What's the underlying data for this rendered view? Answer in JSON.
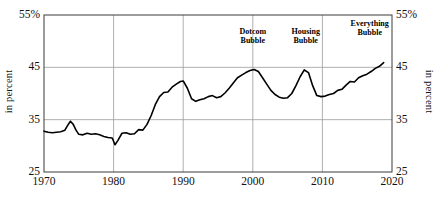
{
  "chart_data": {
    "type": "line",
    "title": "",
    "subtitle": "",
    "xlabel": "",
    "ylabel": "in percent",
    "ylabel_right": "in percent",
    "xlim": [
      1970,
      2020
    ],
    "ylim": [
      25,
      55
    ],
    "grid": true,
    "legend": "none",
    "yticks": [
      25,
      35,
      45,
      55
    ],
    "ytick_labels_left": [
      "25",
      "35",
      "45",
      "55%"
    ],
    "ytick_labels_right": [
      "25",
      "35",
      "45",
      "55%"
    ],
    "xticks": [
      1970,
      1980,
      1990,
      2000,
      2010,
      2020
    ],
    "xtick_labels": [
      "1970",
      "1980",
      "1990",
      "2000",
      "2010",
      "2020"
    ],
    "series": [
      {
        "name": "household equity share",
        "color": "#000000",
        "x": [
          1970.0,
          1970.6,
          1971.2,
          1971.8,
          1972.4,
          1973.0,
          1973.4,
          1973.8,
          1974.2,
          1974.6,
          1975.0,
          1975.6,
          1976.2,
          1976.8,
          1977.4,
          1978.0,
          1978.6,
          1979.2,
          1979.8,
          1980.2,
          1980.6,
          1981.2,
          1981.8,
          1982.4,
          1983.0,
          1983.6,
          1984.2,
          1984.8,
          1985.4,
          1986.0,
          1986.6,
          1987.2,
          1987.8,
          1988.4,
          1989.0,
          1989.6,
          1990.0,
          1990.6,
          1991.2,
          1991.8,
          1992.4,
          1993.0,
          1993.6,
          1994.2,
          1994.8,
          1995.4,
          1996.0,
          1996.6,
          1997.2,
          1997.8,
          1998.4,
          1999.0,
          1999.6,
          2000.2,
          2000.8,
          2001.4,
          2002.0,
          2002.6,
          2003.2,
          2003.8,
          2004.4,
          2005.0,
          2005.6,
          2006.2,
          2006.8,
          2007.4,
          2008.0,
          2008.6,
          2009.2,
          2009.8,
          2010.4,
          2011.0,
          2011.6,
          2012.2,
          2012.8,
          2013.4,
          2014.0,
          2014.6,
          2015.2,
          2015.8,
          2016.4,
          2017.0,
          2017.6,
          2018.2,
          2018.8
        ],
        "y": [
          32.8,
          32.6,
          32.5,
          32.6,
          32.7,
          33.0,
          33.9,
          34.7,
          34.1,
          33.0,
          32.2,
          32.1,
          32.4,
          32.2,
          32.3,
          32.1,
          31.8,
          31.6,
          31.5,
          30.2,
          31.0,
          32.4,
          32.5,
          32.2,
          32.3,
          33.1,
          33.0,
          34.1,
          35.8,
          37.9,
          39.4,
          40.2,
          40.3,
          41.2,
          41.8,
          42.3,
          42.4,
          41.0,
          39.0,
          38.5,
          38.8,
          39.0,
          39.4,
          39.6,
          39.2,
          39.4,
          40.1,
          41.0,
          42.0,
          43.0,
          43.5,
          44.0,
          44.4,
          44.6,
          44.2,
          43.0,
          41.8,
          40.6,
          39.8,
          39.3,
          39.1,
          39.2,
          40.0,
          41.5,
          43.2,
          44.5,
          44.0,
          41.5,
          39.6,
          39.4,
          39.5,
          39.8,
          40.0,
          40.6,
          40.8,
          41.6,
          42.3,
          42.2,
          43.0,
          43.4,
          43.7,
          44.2,
          44.8,
          45.2,
          45.9
        ]
      }
    ],
    "annotations": [
      {
        "text_line1": "Dotcom",
        "text_line2": "Bubble",
        "x": 2000.0,
        "y": 51.0
      },
      {
        "text_line1": "Housing",
        "text_line2": "Bubble",
        "x": 2007.6,
        "y": 51.0
      },
      {
        "text_line1": "Everything",
        "text_line2": "Bubble",
        "x": 2016.8,
        "y": 52.6
      }
    ]
  }
}
